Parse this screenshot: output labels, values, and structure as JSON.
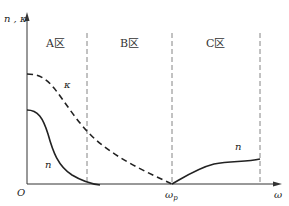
{
  "diagram": {
    "y_axis_label": "n , κ",
    "x_axis_label": "ω",
    "origin_label": "O",
    "plasma_freq_label": {
      "main": "ω",
      "sub": "p"
    },
    "regions": [
      {
        "label": "A区"
      },
      {
        "label": "B区"
      },
      {
        "label": "C区"
      }
    ],
    "curves": [
      {
        "name": "kappa",
        "label": "κ",
        "style": "dashed"
      },
      {
        "name": "n",
        "label": "n",
        "style": "solid",
        "region": "A"
      },
      {
        "name": "n",
        "label": "n",
        "style": "solid",
        "region": "C"
      }
    ],
    "colors": {
      "line": "#222222",
      "divider": "#666666",
      "background": "#ffffff"
    }
  }
}
